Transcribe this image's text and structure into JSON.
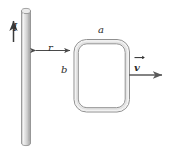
{
  "figure": {
    "background_color": "#ffffff",
    "width": 170,
    "height": 153
  },
  "labels": {
    "current": "I",
    "distance": "r",
    "loop_width": "a",
    "loop_height": "b",
    "velocity": "v"
  },
  "elements": {
    "wire": {
      "name": "straight-current-carrying-wire",
      "orientation": "vertical",
      "fill_color": "#d9d9d9",
      "stroke_color": "#6e6e6e"
    },
    "current_arrow": {
      "name": "current-direction-arrow",
      "direction": "up",
      "stroke_color": "#3a3a3a"
    },
    "distance_arrow": {
      "name": "separation-distance-arrow",
      "direction": "double-headed-horizontal",
      "stroke_color": "#4a4a4a"
    },
    "loop": {
      "name": "rectangular-conducting-loop",
      "shape": "rounded-rectangle-tube",
      "fill_color": "#ffffff",
      "stroke_color": "#8a8a8a"
    },
    "velocity_arrow": {
      "name": "velocity-vector-arrow",
      "direction": "right",
      "stroke_color": "#5a5a5a"
    }
  }
}
